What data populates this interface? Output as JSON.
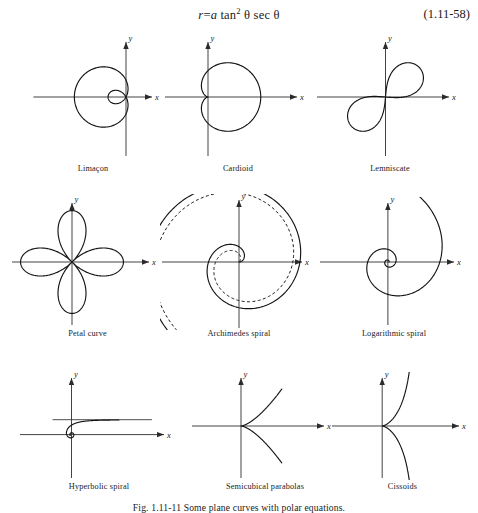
{
  "equation": {
    "lhs": "r",
    "eq": "=",
    "rhs_a": "a",
    "rhs_tan": "tan",
    "rhs_exponent": "2",
    "rhs_theta1": "θ",
    "rhs_sec": "sec",
    "rhs_theta2": "θ",
    "full_text": "r = a tan² θ sec θ",
    "number": "(1.11-58)"
  },
  "axis_labels": {
    "x": "x",
    "y": "y"
  },
  "figure_caption": "Fig. 1.11-11 Some plane curves with polar equations.",
  "chart_data": {
    "type": "line",
    "title": "Some plane curves with polar equations",
    "grid": false,
    "legend": "none",
    "panels": [
      {
        "id": "limacon",
        "label": "Limaçon",
        "equation": "r = b + a cos θ",
        "curve_type": "limacon-with-inner-loop",
        "axes": {
          "xlabel": "x",
          "ylabel": "y"
        },
        "origin_frac": {
          "x": 0.72,
          "y": 0.5
        },
        "params": {
          "b": 0.3,
          "a": 0.62,
          "orientation": "opens-left",
          "inner_loop": true
        }
      },
      {
        "id": "cardioid",
        "label": "Cardioid",
        "equation": "r = a(1 + cos θ)",
        "curve_type": "cardioid",
        "axes": {
          "xlabel": "x",
          "ylabel": "y"
        },
        "origin_frac": {
          "x": 0.3,
          "y": 0.5
        },
        "params": {
          "a": 0.47,
          "cusp": "left",
          "opens": "right"
        }
      },
      {
        "id": "lemniscate",
        "label": "Lemniscate",
        "equation": "r² = a² cos 2θ",
        "curve_type": "lemniscate",
        "axes": {
          "xlabel": "x",
          "ylabel": "y"
        },
        "origin_frac": {
          "x": 0.47,
          "y": 0.5
        },
        "params": {
          "a": 0.8,
          "tilt_deg": 40
        }
      },
      {
        "id": "petal-curve",
        "label": "Petal curve",
        "equation": "r = a cos 2θ",
        "curve_type": "rose",
        "axes": {
          "xlabel": "x",
          "ylabel": "y"
        },
        "origin_frac": {
          "x": 0.4,
          "y": 0.5
        },
        "params": {
          "petals": 4,
          "a": 0.86,
          "phase_deg": 0
        }
      },
      {
        "id": "archimedes-spiral",
        "label": "Archimedes spiral",
        "equation": "r = aθ",
        "curve_type": "archimedean-spiral",
        "axes": {
          "xlabel": "x",
          "ylabel": "y"
        },
        "origin_frac": {
          "x": 0.5,
          "y": 0.5
        },
        "params": {
          "turns": 2.55,
          "a": 0.155,
          "second_branch": "dashed",
          "dashed_offset_deg": 42
        }
      },
      {
        "id": "logarithmic-spiral",
        "label": "Logarithmic spiral",
        "equation": "r = ae^{bθ}",
        "curve_type": "logarithmic-spiral",
        "axes": {
          "xlabel": "x",
          "ylabel": "y"
        },
        "origin_frac": {
          "x": 0.46,
          "y": 0.5
        },
        "params": {
          "turns": 2.45,
          "a": 0.02,
          "b": 0.3
        }
      },
      {
        "id": "hyperbolic-spiral",
        "label": "Hyperbolic spiral",
        "equation": "rθ = a",
        "curve_type": "hyperbolic-spiral",
        "axes": {
          "xlabel": "x",
          "ylabel": "y"
        },
        "origin_frac": {
          "x": 0.33,
          "y": 0.58
        },
        "params": {
          "a": 0.3,
          "asymptote": "horizontal",
          "turns_inner": 1.6
        }
      },
      {
        "id": "semicubical-parabolas",
        "label": "Semicubical parabolas",
        "equation": "ay² = x³",
        "curve_type": "semicubical-parabola",
        "axes": {
          "xlabel": "x",
          "ylabel": "y"
        },
        "origin_frac": {
          "x": 0.34,
          "y": 0.5
        },
        "params": {
          "cusp": "origin",
          "opens": "right",
          "exponent": 1.5
        }
      },
      {
        "id": "cissoids",
        "label": "Cissoids",
        "equation": "x(x² + y²) = 2ay²",
        "curve_type": "cissoid",
        "axes": {
          "xlabel": "x",
          "ylabel": "y"
        },
        "origin_frac": {
          "x": 0.36,
          "y": 0.5
        },
        "params": {
          "cusp": "origin",
          "asymptote": "vertical",
          "a": 0.34
        }
      }
    ]
  }
}
